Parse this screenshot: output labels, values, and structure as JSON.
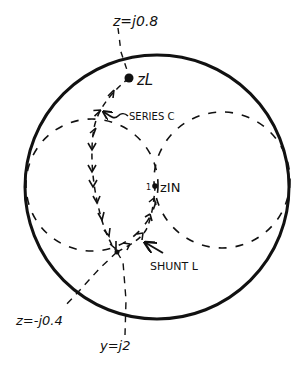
{
  "diagram": {
    "type": "smith-chart-matching",
    "colors": {
      "ink": "#111111",
      "background": "#ffffff"
    },
    "labels": {
      "z_top": "z=j0.8",
      "z_load": "zL",
      "series": "SERIES C",
      "z_in": "zIN",
      "center_mark": "1",
      "shunt": "SHUNT L",
      "z_bottom": "z=-j0.4",
      "y_bottom": "y=j2"
    },
    "elements": [
      {
        "id": "outer-circle",
        "kind": "circle",
        "style": "solid"
      },
      {
        "id": "r1-circle",
        "kind": "circle",
        "style": "dashed"
      },
      {
        "id": "g1-circle",
        "kind": "circle",
        "style": "dashed"
      },
      {
        "id": "series-c-path",
        "kind": "arrow-path",
        "from": "zL",
        "to": "intermediate point"
      },
      {
        "id": "shunt-l-path",
        "kind": "arrow-path",
        "from": "intermediate point",
        "to": "zIN"
      }
    ]
  }
}
